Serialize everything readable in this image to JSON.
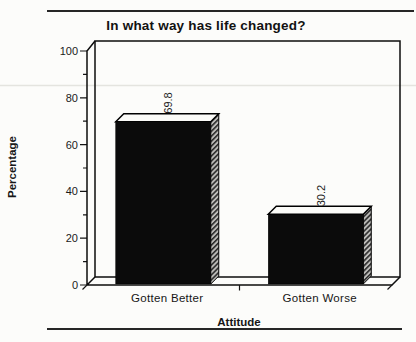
{
  "title": "In what way has life changed?",
  "chart_data": {
    "type": "bar",
    "style": "3d-column-scanned-grayscale",
    "title": "In what way has life changed?",
    "categories": [
      "Gotten Better",
      "Gotten Worse"
    ],
    "values": [
      69.8,
      30.2
    ],
    "value_labels": [
      "69.8",
      "30.2"
    ],
    "xlabel": "Attitude",
    "ylabel": "Percentage",
    "ylim": [
      0,
      100
    ],
    "ytick_labels": [
      "100",
      "80",
      "60",
      "40",
      "20",
      "0"
    ],
    "ytick_values": [
      100,
      80,
      60,
      40,
      20,
      0
    ],
    "minor_ticks": [
      90,
      70,
      50,
      30,
      10
    ],
    "grid": false,
    "legend": "none",
    "value_label_rotation_deg": -90,
    "bar_front_color": "#0b0b0b",
    "bar_top_color": "#fbfbf8",
    "bar_side_fill": "diagonal-hatch",
    "paper_color": "#fcfcfa"
  }
}
